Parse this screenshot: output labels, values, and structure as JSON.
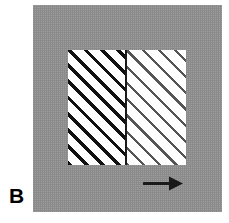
{
  "figure": {
    "panel_label": "B",
    "width": 229,
    "height": 223,
    "background_color": "#ffffff"
  },
  "gray_field": {
    "name": "matrix-background",
    "color": "#9b9b9b",
    "texture": "halftone-dots"
  },
  "specimen": {
    "name": "hatched-specimen-panel",
    "background_color": "#ffffff",
    "hatch_angle_deg": 45,
    "domains": [
      {
        "name": "left-domain",
        "line_color": "#111111",
        "line_weight": "thick",
        "spacing_px": 11.5
      },
      {
        "name": "right-domain",
        "line_color": "#555555",
        "line_weight": "thin",
        "spacing_px": 11.5
      }
    ],
    "boundary": {
      "name": "domain-boundary-line",
      "color": "#1a1a1a",
      "orientation": "vertical"
    }
  },
  "arrow": {
    "name": "direction-arrow",
    "direction": "right",
    "color": "#1a1a1a"
  }
}
